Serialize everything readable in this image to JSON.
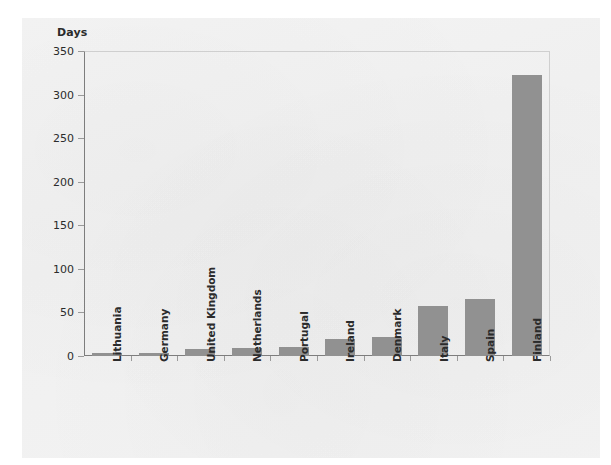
{
  "chart_data": {
    "type": "bar",
    "title": "",
    "subtitle": "",
    "xlabel": "",
    "ylabel": "Days",
    "ylim": [
      0,
      350
    ],
    "yticks": [
      0,
      50,
      100,
      150,
      200,
      250,
      300,
      350
    ],
    "grid": false,
    "legend": null,
    "bar_color": "#919191",
    "categories": [
      "Lithuania",
      "Germany",
      "United Kingdom",
      "Netherlands",
      "Portugal",
      "Ireland",
      "Denmark",
      "Italy",
      "Spain",
      "Finland"
    ],
    "values": [
      3,
      3,
      8,
      9,
      10,
      19,
      22,
      57,
      65,
      322
    ]
  }
}
